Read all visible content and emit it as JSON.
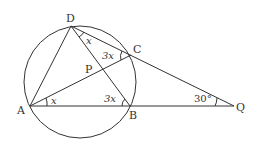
{
  "diagram": {
    "type": "geometry-circle-secant",
    "points": {
      "A": {
        "label": "A",
        "x": 30,
        "y": 106
      },
      "B": {
        "label": "B",
        "x": 130,
        "y": 106
      },
      "C": {
        "label": "C",
        "x": 131,
        "y": 55
      },
      "D": {
        "label": "D",
        "x": 71,
        "y": 26
      },
      "P": {
        "label": "P",
        "x": 88,
        "y": 78
      },
      "Q": {
        "label": "Q",
        "x": 234,
        "y": 106
      }
    },
    "angles": {
      "at_D": "x",
      "at_C": "3x",
      "at_A": "x",
      "at_B": "3x",
      "at_Q": "30°"
    },
    "circle": {
      "cx": 80,
      "cy": 82,
      "r": 57
    },
    "segments": [
      "AD",
      "AC",
      "AB",
      "BD",
      "DC",
      "CQ",
      "BQ"
    ]
  }
}
